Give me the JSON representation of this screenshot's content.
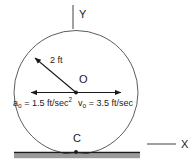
{
  "figure": {
    "axes": {
      "y_label": "Y",
      "x_label": "X"
    },
    "points": {
      "center_label": "O",
      "contact_label": "C"
    },
    "radius": {
      "value": "2",
      "unit": "ft",
      "label": "2 ft"
    },
    "acceleration": {
      "symbol": "a",
      "subscript": "o",
      "equals": "=",
      "value": "1.5",
      "unit": "ft/sec",
      "exponent": "2",
      "full": "a_o = 1.5 ft/sec^2",
      "direction": "left"
    },
    "velocity": {
      "symbol": "v",
      "subscript": "o",
      "equals": "=",
      "value": "3.5",
      "unit": "ft/sec",
      "full": "v_o = 3.5 ft/sec",
      "direction": "right"
    },
    "colors": {
      "stroke": "#3d3d3d",
      "arrow": "#1a1a1a",
      "ground_line": "#1a1a1a",
      "ground_band": "#9a9a9a",
      "axis": "#7a7a7a",
      "text": "#1a1a1a"
    }
  }
}
